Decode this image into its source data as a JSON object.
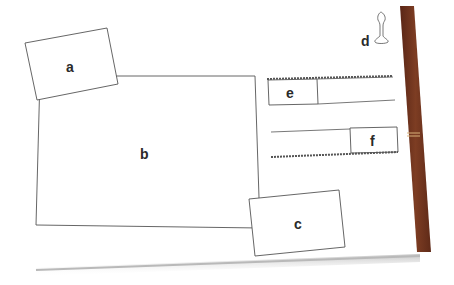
{
  "diagram": {
    "labels": {
      "a": "a",
      "b": "b",
      "c": "c",
      "d": "d",
      "e": "e",
      "f": "f"
    },
    "colors": {
      "line": "#555555",
      "spine": "#7a3a22",
      "spine_dark": "#5a2616",
      "page_shadow": "#c8c8c8"
    }
  }
}
